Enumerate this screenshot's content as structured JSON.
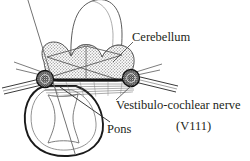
{
  "figure": {
    "type": "anatomical-line-diagram",
    "background_color": "#ffffff",
    "ink_color": "#231f20",
    "stipple_color": "#9a9a9a"
  },
  "labels": {
    "cerebellum": "Cerebellum",
    "nerve": "Vestibulo-cochlear nerve",
    "nerve_number": "(V111)",
    "pons": "Pons"
  },
  "structures": [
    {
      "name": "cerebellum",
      "description": "stippled bilobed mass spanning the upper middle of the figure",
      "fill": "stipple"
    },
    {
      "name": "pons",
      "description": "large rounded outline in the lower left with an hourglass inner contour",
      "fill": "none"
    },
    {
      "name": "midbrain-dome",
      "description": "tall dome outline rising above the cerebellum and cropped by the top edge",
      "fill": "none"
    },
    {
      "name": "left-nerve-node",
      "description": "dark stippled circular nucleus on the left with nerve fibres running out to the left",
      "fill": "dark-stipple"
    },
    {
      "name": "right-nerve-node",
      "description": "dark stippled circular nucleus on the right with nerve fibres running out to the right",
      "fill": "dark-stipple"
    },
    {
      "name": "commissural-tract",
      "description": "thick horizontal bar connecting the left and right nerve nodes"
    },
    {
      "name": "fibre-fan",
      "description": "fan of fine parallel fibres beneath the commissural tract"
    }
  ],
  "leader_lines": [
    {
      "name": "cerebellum-leader",
      "from_label": "cerebellum",
      "to_structure": "cerebellum"
    },
    {
      "name": "nerve-leader",
      "from_label": "nerve",
      "to_structure": "right-nerve-node"
    },
    {
      "name": "pons-leader",
      "from_label": "pons",
      "to_structure": "pons"
    },
    {
      "name": "long-oblique-leader",
      "description": "long diagonal line running from the upper-left edge to the lower-left edge through the figure"
    }
  ]
}
